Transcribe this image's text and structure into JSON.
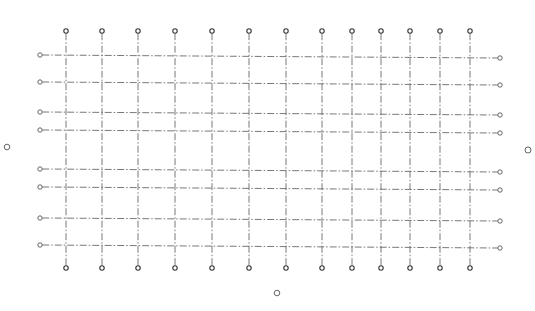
{
  "diagram": {
    "type": "structural-axis-grid",
    "canvas": {
      "width": 535,
      "height": 311,
      "background": "#ffffff"
    },
    "line_color": "#6a6a6a",
    "line_style": "dash-dot",
    "vertical_axes": {
      "x": [
        66,
        102,
        138,
        175,
        212,
        249,
        286,
        322,
        352,
        381,
        410,
        440,
        470
      ],
      "top_y": 31,
      "bottom_y": 268,
      "bubble_radius": 2.2
    },
    "horizontal_axes": {
      "left_x": 40,
      "right_x": 500,
      "y_left": [
        55,
        82,
        112,
        130,
        169,
        187,
        218,
        245
      ],
      "y_right": [
        58,
        85,
        115,
        133,
        172,
        190,
        221,
        248
      ],
      "bubble_radius": 2.2
    },
    "isolated_markers": [
      {
        "name": "left-marker",
        "x": 7,
        "y": 147,
        "r": 2.8
      },
      {
        "name": "right-marker",
        "x": 528,
        "y": 150,
        "r": 3.0
      },
      {
        "name": "bottom-marker",
        "x": 277,
        "y": 293,
        "r": 2.8
      }
    ]
  }
}
